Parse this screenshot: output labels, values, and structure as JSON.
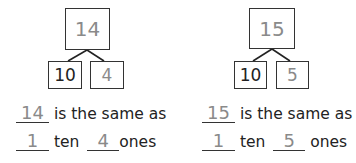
{
  "problems": [
    {
      "whole": "14",
      "tens_part": "10",
      "ones_part": "4",
      "sentence1": {
        "blank": "14",
        "text": "is the same as"
      },
      "sentence2": {
        "tens_blank": "1",
        "tens_word": "ten",
        "ones_blank": "4",
        "ones_word": "ones"
      }
    },
    {
      "whole": "15",
      "tens_part": "10",
      "ones_part": "5",
      "sentence1": {
        "blank": "15",
        "text": "is the same as"
      },
      "sentence2": {
        "tens_blank": "1",
        "tens_word": "ten",
        "ones_blank": "5",
        "ones_word": "ones"
      }
    }
  ],
  "colors": {
    "ink": "#222222",
    "handwritten": "#8a8a8a"
  }
}
